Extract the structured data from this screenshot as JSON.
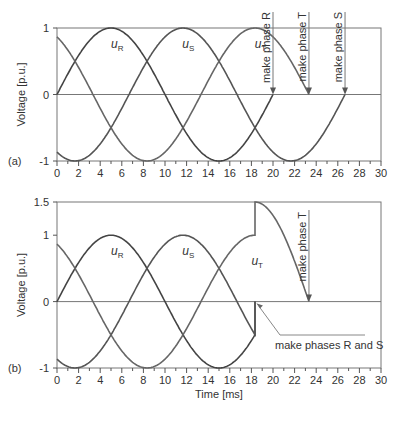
{
  "chart_data": [
    {
      "panel_label": "(a)",
      "type": "line",
      "title": "",
      "xlabel": "",
      "ylabel": "Voltage [p.u.]",
      "xlim": [
        0,
        30
      ],
      "ylim": [
        -1,
        1
      ],
      "xticks": [
        0,
        2,
        4,
        6,
        8,
        10,
        12,
        14,
        16,
        18,
        20,
        22,
        24,
        26,
        28,
        30
      ],
      "yticks": [
        -1,
        0,
        1
      ],
      "ytick_labels": [
        "-1",
        "0",
        "1"
      ],
      "grid": false,
      "period_ms": 20,
      "series": [
        {
          "name": "uR",
          "label_main": "u",
          "label_sub": "R",
          "phase_deg": 0,
          "t_end": 20,
          "label_pos": [
            5.0,
            0.7
          ]
        },
        {
          "name": "uS",
          "label_main": "u",
          "label_sub": "S",
          "phase_deg": -120,
          "t_end": 26.67,
          "label_pos": [
            11.6,
            0.7
          ]
        },
        {
          "name": "uT",
          "label_main": "u",
          "label_sub": "T",
          "phase_deg": 120,
          "t_end": 23.33,
          "label_pos": [
            18.3,
            0.7
          ]
        }
      ],
      "annotations": [
        {
          "text": "make phase R",
          "t": 20,
          "v": 0,
          "type": "vertical-arrow"
        },
        {
          "text": "make phase T",
          "t": 23.33,
          "v": 0,
          "type": "vertical-arrow"
        },
        {
          "text": "make phase S",
          "t": 26.67,
          "v": 0,
          "type": "vertical-arrow"
        }
      ]
    },
    {
      "panel_label": "(b)",
      "type": "line",
      "title": "",
      "xlabel": "Time [ms]",
      "ylabel": "Voltage [p.u.]",
      "xlim": [
        0,
        30
      ],
      "ylim": [
        -1,
        1.5
      ],
      "xticks": [
        0,
        2,
        4,
        6,
        8,
        10,
        12,
        14,
        16,
        18,
        20,
        22,
        24,
        26,
        28,
        30
      ],
      "yticks": [
        -1,
        0,
        1,
        1.5
      ],
      "ytick_labels": [
        "-1",
        "0",
        "1",
        "1.5"
      ],
      "grid": false,
      "period_ms": 20,
      "switch_time_ms": 18.33,
      "series": [
        {
          "name": "uR",
          "label_main": "u",
          "label_sub": "R",
          "phase_deg": 0,
          "after_switch": "zero",
          "label_pos": [
            5.0,
            0.7
          ]
        },
        {
          "name": "uS",
          "label_main": "u",
          "label_sub": "S",
          "phase_deg": -120,
          "after_switch": "zero",
          "label_pos": [
            11.6,
            0.7
          ]
        },
        {
          "name": "uT",
          "label_main": "u",
          "label_sub": "T",
          "phase_deg": 120,
          "after_switch": "jump to 1.5, decay to 0 at 23.33",
          "peak_after_jump": 1.5,
          "zero_at": 23.33,
          "label_pos": [
            18.0,
            0.55
          ]
        }
      ],
      "annotations": [
        {
          "text": "make phase T",
          "t": 23.33,
          "v": 0,
          "type": "vertical-arrow"
        },
        {
          "text": "make phases R and S",
          "t": 18.33,
          "v": 0,
          "type": "leader-arrow"
        }
      ]
    }
  ]
}
